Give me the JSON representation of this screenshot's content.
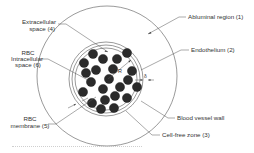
{
  "diagram": {
    "type": "cross-section schematic",
    "colors": {
      "background": "#ffffff",
      "line": "#555555",
      "rbc_fill": "#2b2b2b",
      "text": "#333333"
    },
    "labels": {
      "abluminal_region": "Abluminal region (1)",
      "endothelium": "Endothelium (2)",
      "blood_vessel_wall": "Blood vessel wall",
      "cell_free_zone": "Cell-free zone (3)",
      "extracellular_line1": "Extracellular",
      "extracellular_line2": "space (4)",
      "rbc_intra_line1": "RBC",
      "rbc_intra_line2": "Intracellular",
      "rbc_intra_line3": "space (6)",
      "rbc_membrane_line1": "RBC",
      "rbc_membrane_line2": "membrane (5)",
      "radius_symbol": "R",
      "delta_symbol": "δ"
    },
    "regions": [
      {
        "id": 1,
        "name": "Abluminal region"
      },
      {
        "id": 2,
        "name": "Endothelium"
      },
      {
        "id": 3,
        "name": "Cell-free zone"
      },
      {
        "id": 4,
        "name": "Extracellular space"
      },
      {
        "id": 5,
        "name": "RBC membrane"
      },
      {
        "id": 6,
        "name": "RBC Intracellular space"
      }
    ],
    "rbc_count": 22
  }
}
